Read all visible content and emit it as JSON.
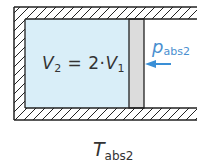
{
  "diagram": {
    "type": "piston-cylinder",
    "gas_volume_label": {
      "symbol": "V",
      "sub1": "2",
      "eq": " = 2·",
      "symbol2": "V",
      "sub2": "1"
    },
    "pressure_label": {
      "symbol": "p",
      "sub": "abs2"
    },
    "temperature_label": {
      "symbol": "T",
      "sub": "abs2"
    },
    "colors": {
      "gas_fill": "#d9eef8",
      "piston_fill": "#dcdcdc",
      "wall_line": "#222222",
      "arrow": "#3a8fd6",
      "pressure_text": "#4a8fd0"
    }
  }
}
